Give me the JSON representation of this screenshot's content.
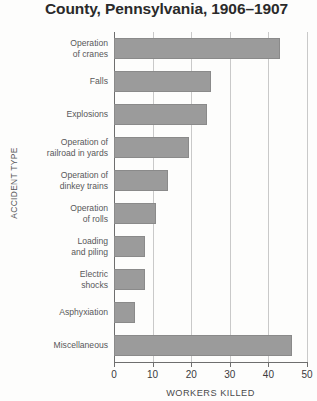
{
  "chart_data": {
    "type": "bar",
    "orientation": "horizontal",
    "title": "County, Pennsylvania, 1906–1907",
    "xlabel": "WORKERS KILLED",
    "ylabel": "ACCIDENT TYPE",
    "categories": [
      "Operation\nof cranes",
      "Falls",
      "Explosions",
      "Operation of\nrailroad in yards",
      "Operation of\ndinkey trains",
      "Operation\nof rolls",
      "Loading\nand piling",
      "Electric\nshocks",
      "Asphyxiation",
      "Miscellaneous"
    ],
    "values": [
      43,
      25,
      24,
      19.5,
      14,
      11,
      8,
      8,
      5.5,
      46
    ],
    "xlim": [
      0,
      50
    ],
    "xticks": [
      0,
      10,
      20,
      30,
      40,
      50
    ],
    "xtick_labels": [
      "0",
      "10",
      "20",
      "30",
      "40",
      "50"
    ],
    "grid": true,
    "grid_axis": "x",
    "legend": false,
    "bar_color": "#9b9b9b",
    "bar_edge_color": "#8a8a8a",
    "background_color": "#fdfdfc",
    "axis_color": "#6e6e6e",
    "gridline_color": "#c9c9c9"
  }
}
